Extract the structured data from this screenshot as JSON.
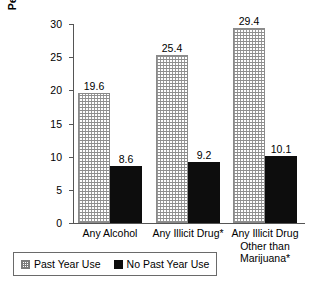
{
  "chart_data": {
    "type": "bar",
    "title": "",
    "xlabel": "",
    "ylabel_line1": "Percent at Risk for Suicide",
    "ylabel_line2": "During the Past Year",
    "ylim": [
      0,
      30
    ],
    "ytick_labels": [
      "0",
      "5",
      "10",
      "15",
      "20",
      "25",
      "30"
    ],
    "ytick_values": [
      0,
      5,
      10,
      15,
      20,
      25,
      30
    ],
    "grid": false,
    "legend_position": "below-left",
    "categories": [
      "Any Alcohol",
      "Any Illicit Drug*",
      "Any Illicit Drug Other than Marijuana*"
    ],
    "category_lines": [
      [
        "Any Alcohol"
      ],
      [
        "Any Illicit Drug*"
      ],
      [
        "Any Illicit Drug",
        "Other than",
        "Marijuana*"
      ]
    ],
    "series": [
      {
        "name": "Past Year Use",
        "values": [
          19.6,
          25.4,
          29.4
        ],
        "labels": [
          "19.6",
          "25.4",
          "29.4"
        ],
        "fill": "hatch",
        "color": "#ffffff"
      },
      {
        "name": "No Past Year Use",
        "values": [
          8.6,
          9.2,
          10.1
        ],
        "labels": [
          "8.6",
          "9.2",
          "10.1"
        ],
        "fill": "solid",
        "color": "#0d0d0d"
      }
    ]
  },
  "legend": {
    "items": [
      {
        "label": "Past Year Use",
        "fill": "hatch"
      },
      {
        "label": "No Past Year Use",
        "fill": "solid"
      }
    ]
  }
}
